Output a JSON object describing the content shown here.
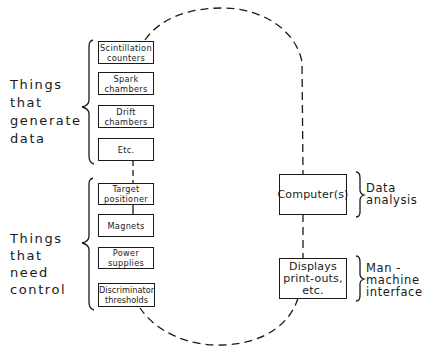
{
  "diagram": {
    "type": "block-diagram",
    "groups": [
      {
        "label": "Things\nthat\ngenerate\ndata",
        "items": [
          {
            "label": "Scintillation\ncounters"
          },
          {
            "label": "Spark\nchambers"
          },
          {
            "label": "Drift\nchambers"
          },
          {
            "label": "Etc."
          }
        ]
      },
      {
        "label": "Things\nthat\nneed\ncontrol",
        "items": [
          {
            "label": "Target\npositioner"
          },
          {
            "label": "Magnets"
          },
          {
            "label": "Power\nsupplies"
          },
          {
            "label": "Discriminator\nthresholds"
          }
        ]
      }
    ],
    "central": [
      {
        "label": "Computer(s)",
        "role": "Data\nanalysis"
      },
      {
        "label": "Displays\nprint-outs,\netc.",
        "role": "Man -\nmachine\ninterface"
      }
    ],
    "connections": [
      {
        "from": "Scintillation counters",
        "to": "Computer(s)",
        "style": "dashed"
      },
      {
        "from": "Computer(s)",
        "to": "Displays print-outs, etc.",
        "style": "dashed"
      },
      {
        "from": "Displays print-outs, etc.",
        "to": "Discriminator thresholds",
        "style": "dashed"
      },
      {
        "from": "Etc.",
        "to": "Target positioner",
        "style": "dashed"
      },
      {
        "from": "Target positioner",
        "to": "Magnets",
        "style": "solid"
      }
    ],
    "colors": {
      "line": "#1a1a1a",
      "background": "#ffffff"
    }
  }
}
